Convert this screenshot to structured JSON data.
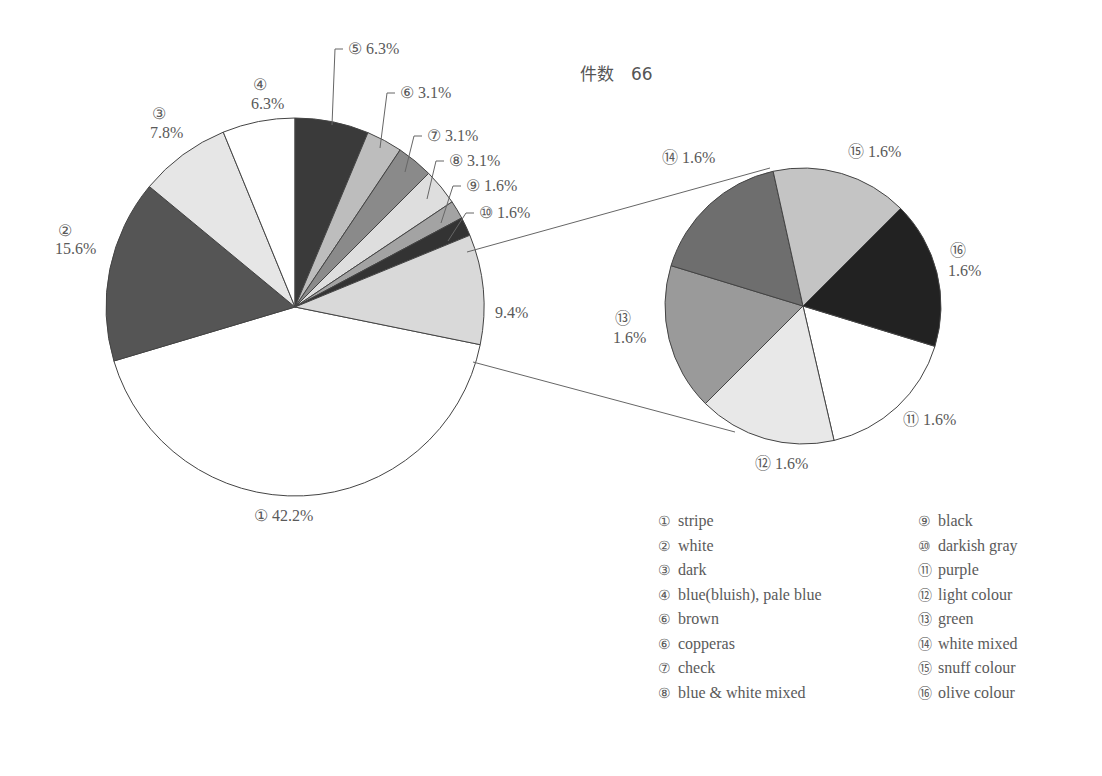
{
  "title": "件数　66",
  "chart_data": {
    "type": "pie",
    "total_count": 66,
    "main_pie": {
      "center": [
        295,
        307
      ],
      "radius": 189,
      "slices": [
        {
          "id": "1",
          "label": "stripe",
          "marker": "①",
          "percent": 42.2,
          "text": "① 42.2%",
          "start": 101.5,
          "end": 253.4,
          "color": "#ffffff"
        },
        {
          "id": "2",
          "label": "white",
          "marker": "②",
          "percent": 15.6,
          "text": "15.6%",
          "start": 253.4,
          "end": 309.6,
          "color": "#555555"
        },
        {
          "id": "3",
          "label": "dark",
          "marker": "③",
          "percent": 7.8,
          "text": "7.8%",
          "start": 309.6,
          "end": 337.7,
          "color": "#e6e6e6"
        },
        {
          "id": "4",
          "label": "blue(bluish), pale blue",
          "marker": "④",
          "percent": 6.3,
          "text": "6.3%",
          "start": 337.7,
          "end": 360,
          "color": "#ffffff"
        },
        {
          "id": "5",
          "label": "brown",
          "marker": "⑤",
          "percent": 6.3,
          "text": "⑤ 6.3%",
          "start": 0,
          "end": 22.7,
          "color": "#3a3a3a"
        },
        {
          "id": "6",
          "label": "copperas",
          "marker": "⑥",
          "percent": 3.1,
          "text": "⑥ 3.1%",
          "start": 22.7,
          "end": 33.8,
          "color": "#bdbdbd"
        },
        {
          "id": "7",
          "label": "check",
          "marker": "⑦",
          "percent": 3.1,
          "text": "⑦ 3.1%",
          "start": 33.8,
          "end": 45.0,
          "color": "#8a8a8a"
        },
        {
          "id": "8",
          "label": "blue & white mixed",
          "marker": "⑧",
          "percent": 3.1,
          "text": "⑧ 3.1%",
          "start": 45.0,
          "end": 56.2,
          "color": "#dedede"
        },
        {
          "id": "9",
          "label": "black",
          "marker": "⑨",
          "percent": 1.6,
          "text": "⑨ 1.6%",
          "start": 56.2,
          "end": 61.9,
          "color": "#a3a3a3"
        },
        {
          "id": "10",
          "label": "darkish gray",
          "marker": "⑩",
          "percent": 1.6,
          "text": "⑩ 1.6%",
          "start": 61.9,
          "end": 67.7,
          "color": "#333333"
        },
        {
          "id": "other",
          "label": "⑪–⑯ combined",
          "marker": "",
          "percent": 9.4,
          "text": "9.4%",
          "start": 67.7,
          "end": 101.5,
          "color": "#d9d9d9"
        }
      ]
    },
    "secondary_pie": {
      "center": [
        803,
        306
      ],
      "radius": 138,
      "slices": [
        {
          "id": "11",
          "label": "purple",
          "marker": "⑪",
          "percent": 1.6,
          "text": "⑪ 1.6%",
          "start": 107,
          "end": 167,
          "color": "#ffffff"
        },
        {
          "id": "12",
          "label": "light colour",
          "marker": "⑫",
          "percent": 1.6,
          "text": "⑫ 1.6%",
          "start": 167,
          "end": 225,
          "color": "#e8e8e8"
        },
        {
          "id": "13",
          "label": "green",
          "marker": "⑬",
          "percent": 1.6,
          "text": "1.6%",
          "start": 225,
          "end": 287,
          "color": "#9a9a9a"
        },
        {
          "id": "14",
          "label": "white mixed",
          "marker": "⑭",
          "percent": 1.6,
          "text": "⑭ 1.6%",
          "start": 287,
          "end": 347.5,
          "color": "#6e6e6e"
        },
        {
          "id": "15",
          "label": "snuff colour",
          "marker": "⑮",
          "percent": 1.6,
          "text": "⑮ 1.6%",
          "start": 347.5,
          "end": 405,
          "color": "#c4c4c4"
        },
        {
          "id": "16",
          "label": "olive colour",
          "marker": "⑯",
          "percent": 1.6,
          "text": "1.6%",
          "start": 45,
          "end": 107,
          "color": "#222222"
        }
      ]
    },
    "legend": [
      {
        "marker": "①",
        "label": "stripe"
      },
      {
        "marker": "②",
        "label": "white"
      },
      {
        "marker": "③",
        "label": "dark"
      },
      {
        "marker": "④",
        "label": "blue(bluish), pale blue"
      },
      {
        "marker": "⑥",
        "label": "brown"
      },
      {
        "marker": "⑥",
        "label": "copperas"
      },
      {
        "marker": "⑦",
        "label": "check"
      },
      {
        "marker": "⑧",
        "label": "blue & white mixed"
      },
      {
        "marker": "⑨",
        "label": "black"
      },
      {
        "marker": "⑩",
        "label": "darkish gray"
      },
      {
        "marker": "⑪",
        "label": "purple"
      },
      {
        "marker": "⑫",
        "label": "light colour"
      },
      {
        "marker": "⑬",
        "label": "green"
      },
      {
        "marker": "⑭",
        "label": "white mixed"
      },
      {
        "marker": "⑮",
        "label": "snuff colour"
      },
      {
        "marker": "⑯",
        "label": "olive colour"
      }
    ]
  },
  "labels": {
    "l1": "① 42.2%",
    "l2_num": "②",
    "l2_pct": "15.6%",
    "l3_num": "③",
    "l3_pct": "7.8%",
    "l4_num": "④",
    "l4_pct": "6.3%",
    "l5": "⑤ 6.3%",
    "l6": "⑥ 3.1%",
    "l7": "⑦ 3.1%",
    "l8": "⑧ 3.1%",
    "l9": "⑨ 1.6%",
    "l10": "⑩ 1.6%",
    "other": "9.4%",
    "l11": "⑪ 1.6%",
    "l12": "⑫ 1.6%",
    "l13_num": "⑬",
    "l13_pct": "1.6%",
    "l14": "⑭ 1.6%",
    "l15": "⑮ 1.6%",
    "l16_num": "⑯",
    "l16_pct": "1.6%"
  }
}
